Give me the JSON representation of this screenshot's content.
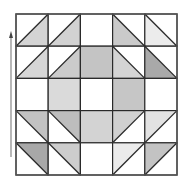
{
  "figure": {
    "type": "quilt-block",
    "grid": {
      "rows": 5,
      "cols": 5,
      "left": 16,
      "top": 14,
      "cell": 32.2
    },
    "line_color": "#2a2a2a",
    "arrow": {
      "direction": "up",
      "x": 11,
      "y_top": 33,
      "y_bottom": 157,
      "color": "#888888"
    },
    "cells": [
      [
        {
          "kind": "half",
          "diag": "/",
          "shaded": "br",
          "fill": "#d4d4d4"
        },
        {
          "kind": "half",
          "diag": "/",
          "shaded": "br",
          "fill": "#d2d2d2"
        },
        {
          "kind": "solid",
          "fill": "#ffffff"
        },
        {
          "kind": "half",
          "diag": "\\",
          "shaded": "bl",
          "fill": "#cacaca"
        },
        {
          "kind": "half",
          "diag": "\\",
          "shaded": "bl",
          "fill": "#ececec"
        }
      ],
      [
        {
          "kind": "half",
          "diag": "/",
          "shaded": "br",
          "fill": "#d6d6d6"
        },
        {
          "kind": "half",
          "diag": "/",
          "shaded": "br",
          "fill": "#cbcbcb"
        },
        {
          "kind": "solid",
          "fill": "#c4c4c4"
        },
        {
          "kind": "half",
          "diag": "\\",
          "shaded": "bl",
          "fill": "#d4d4d4"
        },
        {
          "kind": "half",
          "diag": "\\",
          "shaded": "bl",
          "fill": "#a9a9a9"
        }
      ],
      [
        {
          "kind": "solid",
          "fill": "#ffffff"
        },
        {
          "kind": "solid",
          "fill": "#dadada"
        },
        {
          "kind": "solid",
          "fill": "#ffffff"
        },
        {
          "kind": "solid",
          "fill": "#c6c6c6"
        },
        {
          "kind": "solid",
          "fill": "#ffffff"
        }
      ],
      [
        {
          "kind": "half",
          "diag": "\\",
          "shaded": "tr",
          "fill": "#c2c2c2"
        },
        {
          "kind": "half",
          "diag": "\\",
          "shaded": "tr",
          "fill": "#bdbdbd"
        },
        {
          "kind": "solid",
          "fill": "#d3d3d3"
        },
        {
          "kind": "half",
          "diag": "/",
          "shaded": "tl",
          "fill": "#d0d0d0"
        },
        {
          "kind": "half",
          "diag": "/",
          "shaded": "tl",
          "fill": "#e2e2e2"
        }
      ],
      [
        {
          "kind": "half",
          "diag": "\\",
          "shaded": "tr",
          "fill": "#a8a8a8"
        },
        {
          "kind": "half",
          "diag": "\\",
          "shaded": "tr",
          "fill": "#cdcdcd"
        },
        {
          "kind": "solid",
          "fill": "#ffffff"
        },
        {
          "kind": "half",
          "diag": "/",
          "shaded": "tl",
          "fill": "#ebebeb"
        },
        {
          "kind": "half",
          "diag": "/",
          "shaded": "tl",
          "fill": "#c3c3c3"
        }
      ]
    ]
  }
}
